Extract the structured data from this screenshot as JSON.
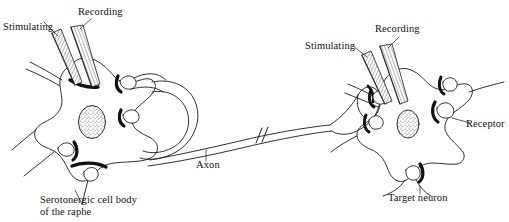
{
  "figure": {
    "width": 509,
    "height": 222,
    "background_color": "#ffffff",
    "ink_color": "#1a1a1a"
  },
  "labels": {
    "stimulating_left": "Stimulating",
    "recording_left": "Recording",
    "stimulating_right": "Stimulating",
    "recording_right": "Recording",
    "axon": "Axon",
    "receptor": "Receptor",
    "cell_body": "Serotonergic cell body\nof the raphe",
    "target_neuron": "Target neuron"
  },
  "diagram_parts": [
    {
      "name": "serotonergic-cell-body",
      "description": "Left multipolar neuron soma with nucleus and dendrites"
    },
    {
      "name": "nucleus-left",
      "description": "Stippled oval nucleus of left neuron"
    },
    {
      "name": "recurrent-collateral",
      "description": "Looping axon collateral returning to the left soma"
    },
    {
      "name": "axon",
      "description": "Long axon with interruption break marks connecting the two neurons"
    },
    {
      "name": "axon-terminal",
      "description": "Terminal bouton contacting the target neuron"
    },
    {
      "name": "target-neuron",
      "description": "Right multipolar neuron soma with nucleus and dendrites"
    },
    {
      "name": "nucleus-right",
      "description": "Stippled oval nucleus of right neuron"
    },
    {
      "name": "receptor-bouton",
      "description": "Synaptic bouton on right neuron indicated by the Receptor label"
    },
    {
      "name": "stimulating-electrode-left",
      "description": "Hatched micropipette angled into the left soma"
    },
    {
      "name": "recording-electrode-left",
      "description": "Hatched micropipette angled into the left soma"
    },
    {
      "name": "stimulating-electrode-right",
      "description": "Hatched micropipette angled into the right soma"
    },
    {
      "name": "recording-electrode-right",
      "description": "Hatched micropipette angled into the right soma"
    }
  ]
}
